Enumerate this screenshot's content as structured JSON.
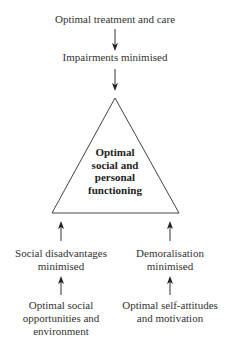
{
  "diagram": {
    "top": {
      "source": "Optimal treatment and care",
      "intermediate": "Impairments minimised"
    },
    "center": {
      "lines": [
        "Optimal",
        "social and",
        "personal",
        "functioning"
      ]
    },
    "left": {
      "outcome_lines": [
        "Social disadvantages",
        "minimised"
      ],
      "source_lines": [
        "Optimal social",
        "opportunities and",
        "environment"
      ]
    },
    "right": {
      "outcome_lines": [
        "Demoralisation",
        "minimised"
      ],
      "source_lines": [
        "Optimal self-attitudes",
        "and motivation"
      ]
    },
    "colors": {
      "line": "#333333",
      "text": "#333333"
    }
  }
}
